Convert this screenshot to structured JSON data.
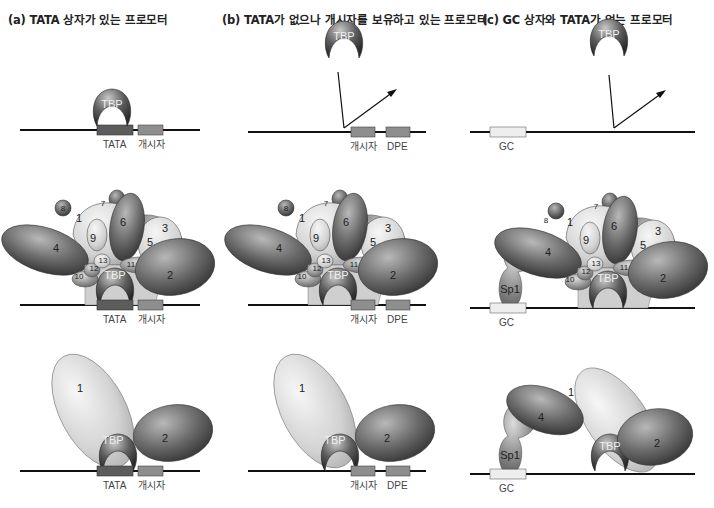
{
  "panels": [
    {
      "id": "a",
      "title": "(a)  TATA 상자가 있는 프로모터",
      "elements": [
        "TATA",
        "개시자"
      ]
    },
    {
      "id": "b",
      "title": "(b)  TATA가 없으나 개시자를 보유하고 있는 프로모터",
      "elements": [
        "개시자",
        "DPE"
      ]
    },
    {
      "id": "c",
      "title": "(c)  GC 상자와 TATA가 없는 프로모터",
      "elements": [
        "GC"
      ]
    }
  ],
  "protein_labels": {
    "tbp": "TBP",
    "sp1": "Sp1",
    "subunits": [
      "1",
      "2",
      "3",
      "4",
      "5",
      "6",
      "7",
      "8",
      "9",
      "10",
      "11",
      "12",
      "13"
    ]
  },
  "colors": {
    "dark": "#5a5a5a",
    "mid": "#8a8a8a",
    "light": "#d4d4d4",
    "dna": "#111111",
    "tata_box": "#5c5c5c",
    "initiator_box": "#8e8e8e",
    "gc_box": "#eeeeee"
  }
}
